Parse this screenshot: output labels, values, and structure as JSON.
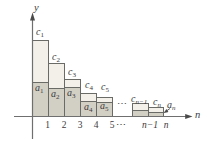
{
  "figure": {
    "y_axis_label": "y",
    "x_axis_label": "n",
    "bars": [
      {
        "c_base": "c",
        "c_sub": "1",
        "a_base": "a",
        "a_sub": "1"
      },
      {
        "c_base": "c",
        "c_sub": "2",
        "a_base": "a",
        "a_sub": "2"
      },
      {
        "c_base": "c",
        "c_sub": "3",
        "a_base": "a",
        "a_sub": "3"
      },
      {
        "c_base": "c",
        "c_sub": "4",
        "a_base": "a",
        "a_sub": "4"
      },
      {
        "c_base": "c",
        "c_sub": "5",
        "a_base": "a",
        "a_sub": "5"
      },
      {
        "c_base": "c",
        "c_sub": "n−1"
      },
      {
        "c_base": "c",
        "c_sub": "n"
      }
    ],
    "a_n_annotation": {
      "base": "a",
      "sub": "n"
    },
    "x_ticks": [
      "1",
      "2",
      "3",
      "4",
      "5",
      "⋯",
      "n−1",
      "n"
    ],
    "mid_ellipsis": "⋯",
    "colors": {
      "c_fill": "#f2f0e9",
      "a_fill": "#d2cfc5",
      "outline": "#6a6a66",
      "axis": "#6f6f6f",
      "text": "#3b3b3b"
    }
  }
}
